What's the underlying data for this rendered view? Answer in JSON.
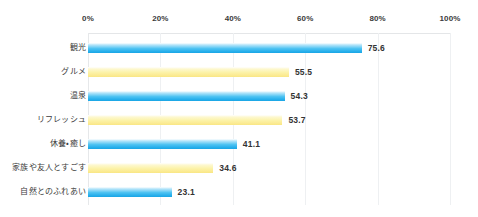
{
  "chart_data": {
    "type": "bar",
    "orientation": "horizontal",
    "title": "",
    "subtitle": "",
    "xlabel": "",
    "ylabel": "",
    "xlim": [
      0,
      100
    ],
    "xtick_step": 20,
    "grid": true,
    "legend": "none",
    "value_label_format": "one-decimal",
    "categories": [
      "観光",
      "グルメ",
      "温泉",
      "リフレッシュ",
      "休養・癒し",
      "家族や友人とすごす",
      "自然とのふれあい"
    ],
    "values": [
      75.6,
      55.5,
      54.3,
      53.7,
      41.1,
      34.6,
      23.1
    ],
    "value_labels": [
      "75.6",
      "55.5",
      "54.3",
      "53.7",
      "41.1",
      "34.6",
      "23.1"
    ],
    "bar_colors": [
      "blue",
      "yellow",
      "blue",
      "yellow",
      "blue",
      "yellow",
      "blue"
    ],
    "xtick_labels": [
      "0%",
      "20%",
      "40%",
      "60%",
      "80%",
      "100%"
    ],
    "xtick_values": [
      0,
      20,
      40,
      60,
      80,
      100
    ]
  },
  "colors": {
    "background": "#ffffff",
    "bar_blue": "#29b0ec",
    "bar_blue_light": "#b9e6fa",
    "bar_yellow": "#fbeb93",
    "bar_yellow_light": "#fdf8cf",
    "gridline": "#eef0f2",
    "axis_rule": "#e4e6e8",
    "tick_text": "#3a3a3a",
    "category_text": "#3d3d3d",
    "value_text": "#333333"
  },
  "footer": {
    "credit_text": ""
  }
}
